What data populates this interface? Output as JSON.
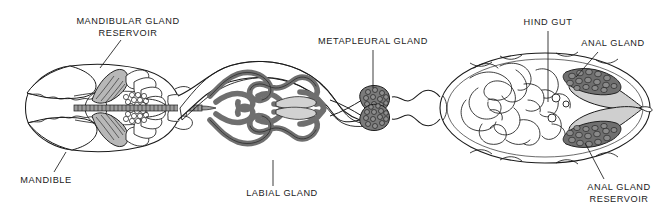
{
  "figure": {
    "background_color": "#ffffff",
    "ink_color": "#1b1b1b",
    "width": 669,
    "height": 216
  },
  "palette": {
    "outline": "#1b1b1b",
    "tubule_gray": "#8e8e8e",
    "tubule_gray_dark": "#6f6f6f",
    "reservoir_light": "#c9c9c9",
    "cluster_dark": "#6b6b6b",
    "cluster_outline": "#2a2a2a",
    "white": "#ffffff",
    "leader_line": "#1b1b1b"
  },
  "labels": [
    {
      "id": "mandibular-gland-reservoir",
      "lines": [
        "MANDIBULAR GLAND",
        "RESERVOIR"
      ],
      "line1": "MANDIBULAR GLAND",
      "line2": "RESERVOIR",
      "x": 128,
      "y": 24,
      "anchor": "middle",
      "leader": {
        "x1": 121,
        "y1": 40,
        "x2": 100,
        "y2": 68
      }
    },
    {
      "id": "metapleural-gland",
      "lines": [
        "METAPLEURAL GLAND"
      ],
      "line1": "METAPLEURAL GLAND",
      "x": 373,
      "y": 44,
      "anchor": "middle",
      "leader": {
        "x1": 373,
        "y1": 50,
        "x2": 373,
        "y2": 88
      }
    },
    {
      "id": "hind-gut",
      "lines": [
        "HIND GUT"
      ],
      "line1": "HIND GUT",
      "x": 548,
      "y": 25,
      "anchor": "middle",
      "leader": {
        "x1": 548,
        "y1": 31,
        "x2": 548,
        "y2": 102
      }
    },
    {
      "id": "anal-gland",
      "lines": [
        "ANAL GLAND"
      ],
      "line1": "ANAL GLAND",
      "x": 613,
      "y": 46,
      "anchor": "middle",
      "leader": {
        "x1": 598,
        "y1": 52,
        "x2": 576,
        "y2": 77
      }
    },
    {
      "id": "mandible",
      "lines": [
        "MANDIBLE"
      ],
      "line1": "MANDIBLE",
      "x": 46,
      "y": 183,
      "anchor": "middle",
      "leader": {
        "x1": 54,
        "y1": 172,
        "x2": 66,
        "y2": 152
      }
    },
    {
      "id": "labial-gland",
      "lines": [
        "LABIAL GLAND"
      ],
      "line1": "LABIAL GLAND",
      "x": 282,
      "y": 196,
      "anchor": "middle",
      "leader": {
        "x1": 273,
        "y1": 186,
        "x2": 273,
        "y2": 160
      }
    },
    {
      "id": "anal-gland-reservoir",
      "lines": [
        "ANAL GLAND",
        "RESERVOIR"
      ],
      "line1": "ANAL GLAND",
      "line2": "RESERVOIR",
      "x": 619,
      "y": 190,
      "anchor": "middle",
      "leader": {
        "x1": 604,
        "y1": 179,
        "x2": 585,
        "y2": 143
      }
    }
  ],
  "structures": [
    {
      "id": "head",
      "name": "head capsule"
    },
    {
      "id": "mandible-left",
      "name": "mandible (upper)"
    },
    {
      "id": "mandible-right",
      "name": "mandible (lower)"
    },
    {
      "id": "mandibular-gland-reservoir-upper",
      "name": "mandibular gland reservoir (upper)"
    },
    {
      "id": "mandibular-gland-reservoir-lower",
      "name": "mandibular gland reservoir (lower)"
    },
    {
      "id": "cephalic-cluster-upper",
      "name": "cephalic gland cluster (upper)"
    },
    {
      "id": "cephalic-cluster-lower",
      "name": "cephalic gland cluster (lower)"
    },
    {
      "id": "esophagus",
      "name": "esophagus / segmented gut tube"
    },
    {
      "id": "thorax",
      "name": "thorax (mesosoma)"
    },
    {
      "id": "labial-gland-upper",
      "name": "labial gland tubules (upper)"
    },
    {
      "id": "labial-gland-lower",
      "name": "labial gland tubules (lower)"
    },
    {
      "id": "labial-sac-upper",
      "name": "labial gland sac (upper)"
    },
    {
      "id": "labial-sac-lower",
      "name": "labial gland sac (lower)"
    },
    {
      "id": "metapleural-gland-upper",
      "name": "metapleural gland (upper)"
    },
    {
      "id": "metapleural-gland-lower",
      "name": "metapleural gland (lower)"
    },
    {
      "id": "petiole",
      "name": "petiole / waist"
    },
    {
      "id": "gaster",
      "name": "gaster (abdomen)"
    },
    {
      "id": "hind-gut-coils",
      "name": "hind gut and malpighian tubule coils"
    },
    {
      "id": "anal-gland-upper",
      "name": "anal gland (upper)"
    },
    {
      "id": "anal-gland-lower",
      "name": "anal gland (lower)"
    },
    {
      "id": "anal-reservoir-upper",
      "name": "anal gland reservoir (upper)"
    },
    {
      "id": "anal-reservoir-lower",
      "name": "anal gland reservoir (lower)"
    }
  ]
}
